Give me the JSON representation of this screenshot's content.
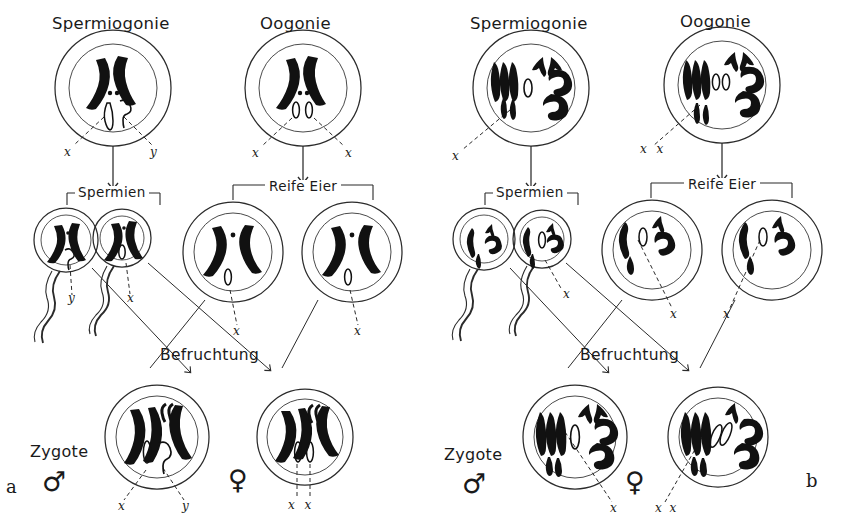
{
  "figure": {
    "panels": [
      "a",
      "b"
    ],
    "panel_a_label": "a",
    "panel_b_label": "b"
  },
  "labels": {
    "spermiogonie": "Spermiogonie",
    "oogonie": "Oogonie",
    "spermien": "Spermien",
    "reife_eier": "Reife Eier",
    "befruchtung": "Befruchtung",
    "zygote": "Zygote",
    "x": "x",
    "y": "y",
    "xx": "x x",
    "male_symbol": "♂",
    "female_symbol": "♀"
  },
  "panel_a": {
    "title_left": "Spermiogonie",
    "title_right": "Oogonie",
    "sperm_box": "Spermien",
    "egg_box": "Reife Eier",
    "fertilization": "Befruchtung",
    "zygote_label": "Zygote",
    "spermiogonie_gametes": [
      "x",
      "y"
    ],
    "oogonie_gametes": [
      "x",
      "x"
    ],
    "sperm_cells": [
      {
        "name": "sperm-y",
        "marker": "y"
      },
      {
        "name": "sperm-x",
        "marker": "x"
      }
    ],
    "egg_cells": [
      {
        "name": "egg-x-left",
        "marker": "x"
      },
      {
        "name": "egg-x-right",
        "marker": "x"
      }
    ],
    "zygotes": [
      {
        "name": "zygote-male",
        "sex": "♂",
        "constitution": [
          "x",
          "y"
        ]
      },
      {
        "name": "zygote-female",
        "sex": "♀",
        "constitution": [
          "x",
          "x"
        ]
      }
    ],
    "panel_letter": "a"
  },
  "panel_b": {
    "title_left": "Spermiogonie",
    "title_right": "Oogonie",
    "sperm_box": "Spermien",
    "egg_box": "Reife Eier",
    "fertilization": "Befruchtung",
    "zygote_label": "Zygote",
    "spermiogonie_gametes": [
      "x"
    ],
    "oogonie_gametes": [
      "x x"
    ],
    "sperm_cells": [
      {
        "name": "sperm-no-x",
        "marker": ""
      },
      {
        "name": "sperm-x",
        "marker": "x"
      }
    ],
    "egg_cells": [
      {
        "name": "egg-x-left",
        "marker": "x"
      },
      {
        "name": "egg-x-right",
        "marker": "x"
      }
    ],
    "zygotes": [
      {
        "name": "zygote-male",
        "sex": "♂",
        "constitution": [
          "x"
        ]
      },
      {
        "name": "zygote-female",
        "sex": "♀",
        "constitution": [
          "x x"
        ]
      }
    ],
    "panel_letter": "b"
  },
  "colors": {
    "ink": "#1a1a1a",
    "line": "#2b2b2b",
    "background": "#ffffff"
  }
}
